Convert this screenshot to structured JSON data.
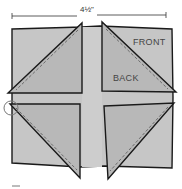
{
  "diagram": {
    "dimension_label": "4½\"",
    "labels": {
      "front": "FRONT",
      "back": "BACK"
    },
    "colors": {
      "fabric": "#b9b9b9",
      "fabric_light": "#c8c8c8",
      "outline": "#1a1a1a",
      "stitch": "#555555",
      "background": "#ffffff"
    },
    "parts": [
      "background-square",
      "top-left-triangle",
      "top-right-triangle",
      "bottom-left-triangle",
      "bottom-right-triangle",
      "corner-circle-marker"
    ]
  }
}
